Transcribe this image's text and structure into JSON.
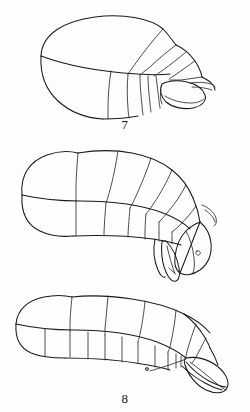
{
  "plate": {
    "title": "Scientific line-drawing plate",
    "background_color": "#fefefe",
    "ink_color": "#1a1a1a",
    "width": 250,
    "height": 412,
    "figure_count": 3
  },
  "figures": [
    {
      "label": "7",
      "name": "figure-7",
      "description": "Lateral view of a short, broad ovoid segmented abdomen with posterior segments narrowing to a rounded terminal lobe",
      "orientation": "lateral, anterior to the left",
      "segment_count": 6
    },
    {
      "label": "8",
      "name": "figure-8",
      "description": "Lateral view of an elongate segmented abdomen with large anterior tergites and a down-curved posterior bearing pendant appendages",
      "orientation": "lateral, anterior to the left",
      "segment_count": 7
    },
    {
      "label": "9",
      "name": "figure-9",
      "description": "Lateral view of an elongate segmented abdomen with a tapering posterior and projecting terminal appendages",
      "orientation": "lateral, anterior to the left",
      "segment_count": 7
    }
  ]
}
